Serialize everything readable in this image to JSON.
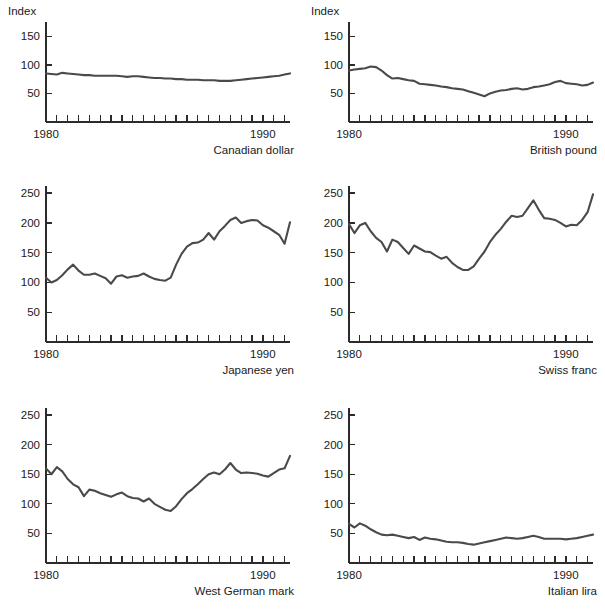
{
  "figure": {
    "axis_label": "Index",
    "x_start_label": "1980",
    "x_end_label": "1990",
    "line_color": "#4a4a4a",
    "axis_color": "#2b2b2b",
    "background": "#ffffff"
  },
  "chart_data": [
    {
      "type": "line",
      "title": "Canadian dollar",
      "ylabel": "Index",
      "xlabel": "",
      "ylim": [
        0,
        175
      ],
      "yticks": [
        50,
        100,
        150
      ],
      "xlim": [
        1980,
        1991.25
      ],
      "xtick_labels": [
        "1980",
        "1990"
      ],
      "grid": false,
      "legend": "none",
      "x": [
        1980.0,
        1980.25,
        1980.5,
        1980.75,
        1981.0,
        1981.25,
        1981.5,
        1981.75,
        1982.0,
        1982.25,
        1982.5,
        1982.75,
        1983.0,
        1983.25,
        1983.5,
        1983.75,
        1984.0,
        1984.25,
        1984.5,
        1984.75,
        1985.0,
        1985.25,
        1985.5,
        1985.75,
        1986.0,
        1986.25,
        1986.5,
        1986.75,
        1987.0,
        1987.25,
        1987.5,
        1987.75,
        1988.0,
        1988.25,
        1988.5,
        1988.75,
        1989.0,
        1989.25,
        1989.5,
        1989.75,
        1990.0,
        1990.25,
        1990.5,
        1990.75,
        1991.0,
        1991.25
      ],
      "values": [
        85,
        84,
        83,
        86,
        85,
        84,
        83,
        82,
        82,
        81,
        81,
        81,
        81,
        81,
        80,
        79,
        80,
        80,
        79,
        78,
        77,
        77,
        76,
        76,
        75,
        75,
        74,
        74,
        74,
        73,
        73,
        73,
        72,
        72,
        72,
        73,
        74,
        75,
        76,
        77,
        78,
        79,
        80,
        81,
        83,
        85
      ]
    },
    {
      "type": "line",
      "title": "British pound",
      "ylabel": "Index",
      "xlabel": "",
      "ylim": [
        0,
        175
      ],
      "yticks": [
        50,
        100,
        150
      ],
      "xlim": [
        1980,
        1991.25
      ],
      "xtick_labels": [
        "1980",
        "1990"
      ],
      "grid": false,
      "legend": "none",
      "x": [
        1980.0,
        1980.25,
        1980.5,
        1980.75,
        1981.0,
        1981.25,
        1981.5,
        1981.75,
        1982.0,
        1982.25,
        1982.5,
        1982.75,
        1983.0,
        1983.25,
        1983.5,
        1983.75,
        1984.0,
        1984.25,
        1984.5,
        1984.75,
        1985.0,
        1985.25,
        1985.5,
        1985.75,
        1986.0,
        1986.25,
        1986.5,
        1986.75,
        1987.0,
        1987.25,
        1987.5,
        1987.75,
        1988.0,
        1988.25,
        1988.5,
        1988.75,
        1989.0,
        1989.25,
        1989.5,
        1989.75,
        1990.0,
        1990.25,
        1990.5,
        1990.75,
        1991.0,
        1991.25
      ],
      "values": [
        90,
        92,
        93,
        94,
        97,
        96,
        90,
        82,
        76,
        77,
        75,
        73,
        72,
        67,
        66,
        65,
        64,
        62,
        61,
        59,
        58,
        57,
        54,
        51,
        48,
        45,
        50,
        53,
        55,
        56,
        58,
        59,
        57,
        58,
        61,
        62,
        64,
        66,
        70,
        72,
        68,
        67,
        66,
        64,
        65,
        69
      ]
    },
    {
      "type": "line",
      "title": "Japanese yen",
      "ylabel": "Index",
      "xlabel": "",
      "ylim": [
        0,
        262
      ],
      "yticks": [
        50,
        100,
        150,
        200,
        250
      ],
      "xlim": [
        1980,
        1991.25
      ],
      "xtick_labels": [
        "1980",
        "1990"
      ],
      "grid": false,
      "legend": "none",
      "x": [
        1980.0,
        1980.25,
        1980.5,
        1980.75,
        1981.0,
        1981.25,
        1981.5,
        1981.75,
        1982.0,
        1982.25,
        1982.5,
        1982.75,
        1983.0,
        1983.25,
        1983.5,
        1983.75,
        1984.0,
        1984.25,
        1984.5,
        1984.75,
        1985.0,
        1985.25,
        1985.5,
        1985.75,
        1986.0,
        1986.25,
        1986.5,
        1986.75,
        1987.0,
        1987.25,
        1987.5,
        1987.75,
        1988.0,
        1988.25,
        1988.5,
        1988.75,
        1989.0,
        1989.25,
        1989.5,
        1989.75,
        1990.0,
        1990.25,
        1990.5,
        1990.75,
        1991.0,
        1991.25
      ],
      "values": [
        108,
        100,
        104,
        112,
        122,
        130,
        120,
        113,
        113,
        115,
        111,
        107,
        98,
        110,
        112,
        108,
        110,
        111,
        115,
        110,
        106,
        104,
        103,
        108,
        130,
        148,
        160,
        166,
        167,
        172,
        183,
        172,
        186,
        195,
        205,
        209,
        200,
        203,
        205,
        204,
        196,
        192,
        186,
        180,
        165,
        201
      ]
    },
    {
      "type": "line",
      "title": "Swiss franc",
      "ylabel": "Index",
      "xlabel": "",
      "ylim": [
        0,
        262
      ],
      "yticks": [
        50,
        100,
        150,
        200,
        250
      ],
      "xlim": [
        1980,
        1991.25
      ],
      "xtick_labels": [
        "1980",
        "1990"
      ],
      "grid": false,
      "legend": "none",
      "x": [
        1980.0,
        1980.25,
        1980.5,
        1980.75,
        1981.0,
        1981.25,
        1981.5,
        1981.75,
        1982.0,
        1982.25,
        1982.5,
        1982.75,
        1983.0,
        1983.25,
        1983.5,
        1983.75,
        1984.0,
        1984.25,
        1984.5,
        1984.75,
        1985.0,
        1985.25,
        1985.5,
        1985.75,
        1986.0,
        1986.25,
        1986.5,
        1986.75,
        1987.0,
        1987.25,
        1987.5,
        1987.75,
        1988.0,
        1988.25,
        1988.5,
        1988.75,
        1989.0,
        1989.25,
        1989.5,
        1989.75,
        1990.0,
        1990.25,
        1990.5,
        1990.75,
        1991.0,
        1991.25
      ],
      "values": [
        198,
        183,
        196,
        200,
        186,
        175,
        168,
        152,
        172,
        168,
        158,
        148,
        162,
        157,
        152,
        151,
        145,
        140,
        143,
        133,
        126,
        121,
        121,
        127,
        140,
        152,
        168,
        180,
        190,
        202,
        212,
        210,
        212,
        225,
        238,
        222,
        208,
        207,
        205,
        200,
        194,
        197,
        196,
        205,
        218,
        248
      ]
    },
    {
      "type": "line",
      "title": "West German mark",
      "ylabel": "Index",
      "xlabel": "",
      "ylim": [
        0,
        262
      ],
      "yticks": [
        50,
        100,
        150,
        200,
        250
      ],
      "xlim": [
        1980,
        1991.25
      ],
      "xtick_labels": [
        "1980",
        "1990"
      ],
      "grid": false,
      "legend": "none",
      "x": [
        1980.0,
        1980.25,
        1980.5,
        1980.75,
        1981.0,
        1981.25,
        1981.5,
        1981.75,
        1982.0,
        1982.25,
        1982.5,
        1982.75,
        1983.0,
        1983.25,
        1983.5,
        1983.75,
        1984.0,
        1984.25,
        1984.5,
        1984.75,
        1985.0,
        1985.25,
        1985.5,
        1985.75,
        1986.0,
        1986.25,
        1986.5,
        1986.75,
        1987.0,
        1987.25,
        1987.5,
        1987.75,
        1988.0,
        1988.25,
        1988.5,
        1988.75,
        1989.0,
        1989.25,
        1989.5,
        1989.75,
        1990.0,
        1990.25,
        1990.5,
        1990.75,
        1991.0,
        1991.25
      ],
      "values": [
        160,
        150,
        162,
        155,
        142,
        133,
        128,
        113,
        124,
        122,
        118,
        115,
        112,
        116,
        119,
        113,
        110,
        109,
        104,
        109,
        100,
        95,
        90,
        88,
        96,
        108,
        118,
        125,
        133,
        142,
        150,
        153,
        150,
        158,
        169,
        158,
        152,
        153,
        152,
        151,
        148,
        146,
        152,
        158,
        160,
        181
      ]
    },
    {
      "type": "line",
      "title": "Italian lira",
      "ylabel": "Index",
      "xlabel": "",
      "ylim": [
        0,
        262
      ],
      "yticks": [
        50,
        100,
        150,
        200,
        250
      ],
      "xlim": [
        1980,
        1991.25
      ],
      "xtick_labels": [
        "1980",
        "1990"
      ],
      "grid": false,
      "legend": "none",
      "x": [
        1980.0,
        1980.25,
        1980.5,
        1980.75,
        1981.0,
        1981.25,
        1981.5,
        1981.75,
        1982.0,
        1982.25,
        1982.5,
        1982.75,
        1983.0,
        1983.25,
        1983.5,
        1983.75,
        1984.0,
        1984.25,
        1984.5,
        1984.75,
        1985.0,
        1985.25,
        1985.5,
        1985.75,
        1986.0,
        1986.25,
        1986.5,
        1986.75,
        1987.0,
        1987.25,
        1987.5,
        1987.75,
        1988.0,
        1988.25,
        1988.5,
        1988.75,
        1989.0,
        1989.25,
        1989.5,
        1989.75,
        1990.0,
        1990.25,
        1990.5,
        1990.75,
        1991.0,
        1991.25
      ],
      "values": [
        66,
        60,
        67,
        63,
        57,
        52,
        48,
        47,
        48,
        46,
        44,
        42,
        44,
        39,
        43,
        41,
        40,
        38,
        36,
        35,
        35,
        34,
        32,
        31,
        33,
        35,
        37,
        39,
        41,
        43,
        42,
        41,
        42,
        44,
        46,
        44,
        41,
        41,
        41,
        41,
        40,
        41,
        42,
        44,
        46,
        48
      ]
    }
  ],
  "panels": [
    {
      "caption": "Canadian dollar",
      "index_label": "Index",
      "x_start": "1980",
      "x_end": "1990"
    },
    {
      "caption": "British pound",
      "index_label": "Index",
      "x_start": "1980",
      "x_end": "1990"
    },
    {
      "caption": "Japanese yen",
      "index_label": "",
      "x_start": "1980",
      "x_end": "1990"
    },
    {
      "caption": "Swiss franc",
      "index_label": "",
      "x_start": "1980",
      "x_end": "1990"
    },
    {
      "caption": "West German mark",
      "index_label": "",
      "x_start": "1980",
      "x_end": "1990"
    },
    {
      "caption": "Italian lira",
      "index_label": "",
      "x_start": "1980",
      "x_end": "1990"
    }
  ]
}
